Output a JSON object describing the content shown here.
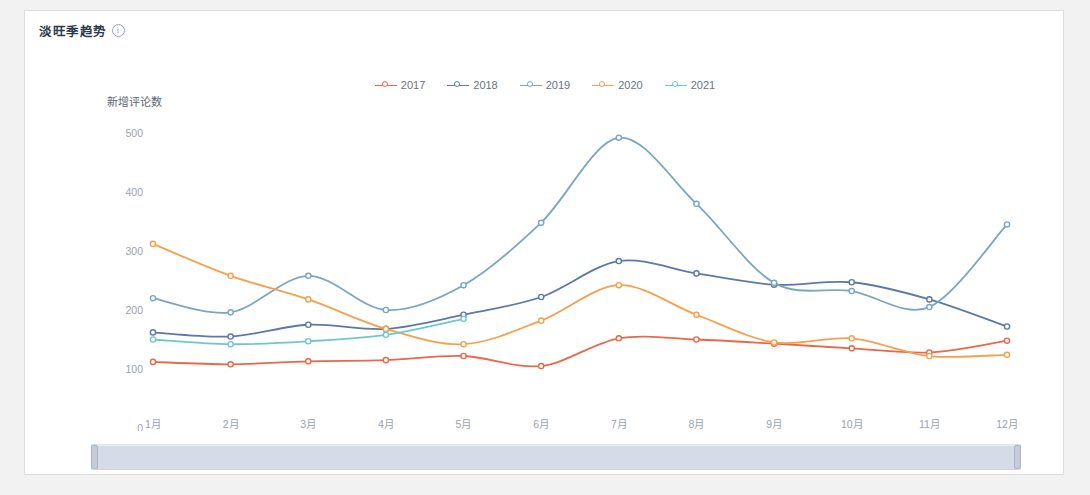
{
  "card": {
    "title": "淡旺季趋势",
    "info_icon": "info-circle-icon"
  },
  "chart_data": {
    "type": "line",
    "title": "淡旺季趋势",
    "xlabel": "",
    "ylabel": "新增评论数",
    "categories": [
      "1月",
      "2月",
      "3月",
      "4月",
      "5月",
      "6月",
      "7月",
      "8月",
      "9月",
      "10月",
      "11月",
      "12月"
    ],
    "ylim": [
      0,
      500
    ],
    "yticks": [
      0,
      100,
      200,
      300,
      400,
      500
    ],
    "grid": false,
    "legend_position": "top-center",
    "smooth": true,
    "series": [
      {
        "name": "2017",
        "color": "#e8684a",
        "values": [
          112,
          108,
          113,
          115,
          122,
          105,
          152,
          150,
          143,
          135,
          128,
          148
        ]
      },
      {
        "name": "2018",
        "color": "#5b79a8",
        "values": [
          162,
          155,
          175,
          168,
          192,
          222,
          283,
          262,
          243,
          247,
          218,
          172
        ]
      },
      {
        "name": "2019",
        "color": "#7aa6c2",
        "values": [
          220,
          196,
          258,
          200,
          242,
          348,
          492,
          380,
          246,
          232,
          205,
          345
        ]
      },
      {
        "name": "2020",
        "color": "#f6a04d",
        "values": [
          312,
          258,
          218,
          168,
          142,
          182,
          242,
          192,
          145,
          152,
          122,
          124
        ]
      },
      {
        "name": "2021",
        "color": "#6fc6cf",
        "values": [
          150,
          142,
          147,
          158,
          185,
          null,
          null,
          null,
          null,
          null,
          null,
          null
        ]
      }
    ]
  },
  "data_zoom": {
    "name": "range-slider",
    "start_percent": 0,
    "end_percent": 100,
    "left_handle": "slider-handle-left",
    "right_handle": "slider-handle-right"
  }
}
